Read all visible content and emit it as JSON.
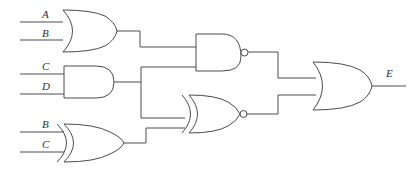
{
  "diagram": {
    "background_color": "#ffffff",
    "line_color": "#4a4a55",
    "label_color": "#2e2e38"
  },
  "inputs": [
    {
      "id": "in-a-top",
      "label": "A",
      "x": 44,
      "y": 18,
      "wire_y": 22,
      "wire_x_start": 20,
      "wire_x_end": 63
    },
    {
      "id": "in-b-top",
      "label": "B",
      "x": 44,
      "y": 36,
      "wire_y": 40,
      "wire_x_start": 20,
      "wire_x_end": 63
    },
    {
      "id": "in-c-mid",
      "label": "C",
      "x": 44,
      "y": 70,
      "wire_y": 74,
      "wire_x_start": 20,
      "wire_x_end": 64
    },
    {
      "id": "in-d-mid",
      "label": "D",
      "x": 44,
      "y": 90,
      "wire_y": 94,
      "wire_x_start": 20,
      "wire_x_end": 64
    },
    {
      "id": "in-b-bot",
      "label": "B",
      "x": 44,
      "y": 128,
      "wire_y": 132,
      "wire_x_start": 20,
      "wire_x_end": 62
    },
    {
      "id": "in-c-bot",
      "label": "C",
      "x": 44,
      "y": 148,
      "wire_y": 152,
      "wire_x_start": 20,
      "wire_x_end": 62
    }
  ],
  "outputs": [
    {
      "id": "out-e",
      "label": "E",
      "x": 388,
      "y": 76,
      "wire_y": 86,
      "wire_x_start": 370,
      "wire_x_end": 406
    }
  ],
  "gates": [
    {
      "id": "gate-or-1",
      "type": "or",
      "label": "OR",
      "inputs": [
        "A",
        "B"
      ],
      "output_to": "gate-nand-1"
    },
    {
      "id": "gate-and-1",
      "type": "and",
      "label": "AND",
      "inputs": [
        "C",
        "D"
      ],
      "output_to": "gate-nand-1, gate-xnor-1"
    },
    {
      "id": "gate-xor-1",
      "type": "xor",
      "label": "XOR",
      "inputs": [
        "B",
        "C"
      ],
      "output_to": "gate-xnor-1"
    },
    {
      "id": "gate-nand-1",
      "type": "nand",
      "label": "NAND",
      "inputs": [
        "gate-or-1",
        "gate-and-1"
      ],
      "output_to": "gate-or-2"
    },
    {
      "id": "gate-xnor-1",
      "type": "xnor",
      "label": "XNOR",
      "inputs": [
        "gate-and-1",
        "gate-xor-1"
      ],
      "output_to": "gate-or-2"
    },
    {
      "id": "gate-or-2",
      "type": "or",
      "label": "OR",
      "inputs": [
        "gate-nand-1",
        "gate-xnor-1"
      ],
      "output_to": "E"
    }
  ]
}
